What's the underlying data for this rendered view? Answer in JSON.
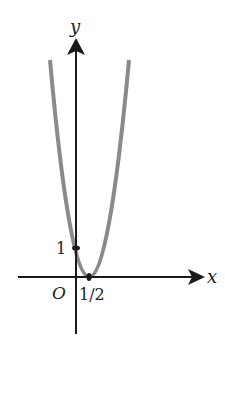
{
  "figure": {
    "type": "function-graph",
    "function": "y = (2x - 1)^2",
    "axes": {
      "x_label": "x",
      "y_label": "y",
      "origin_label": "O"
    },
    "marks": {
      "y_intercept_label": "1",
      "vertex_x_label": "1/2"
    },
    "colors": {
      "axes": "#1a1a1a",
      "curve": "#8a8a8a",
      "background": "#ffffff"
    }
  }
}
